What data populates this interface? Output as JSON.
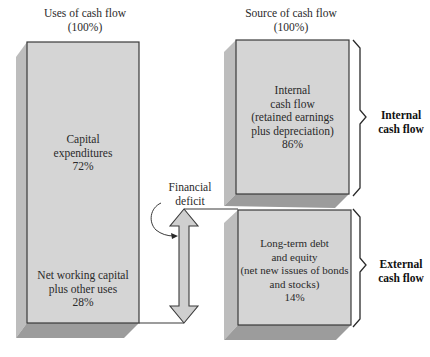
{
  "uses": {
    "title": "Uses of cash flow",
    "total": "(100%)",
    "capex": {
      "line1": "Capital",
      "line2": "expenditures",
      "pct": "72%"
    },
    "nwc": {
      "line1": "Net working capital",
      "line2": "plus other uses",
      "pct": "28%"
    }
  },
  "source": {
    "title": "Source of cash flow",
    "total": "(100%)",
    "internal": {
      "line1": "Internal",
      "line2": "cash flow",
      "line3": "(retained earnings",
      "line4": "plus depreciation)",
      "pct": "86%"
    },
    "external": {
      "line1": "Long-term debt",
      "line2": "and equity",
      "line3": "(net new issues of bonds",
      "line4": "and stocks)",
      "pct": "14%"
    }
  },
  "annotations": {
    "deficit_line1": "Financial",
    "deficit_line2": "deficit",
    "internal_brace_line1": "Internal",
    "internal_brace_line2": "cash flow",
    "external_brace_line1": "External",
    "external_brace_line2": "cash flow"
  },
  "colors": {
    "face": "#d4d4d4",
    "side": "#b9b9b9",
    "shadow": "#9e9e9e",
    "edge": "#3a3a3a"
  }
}
